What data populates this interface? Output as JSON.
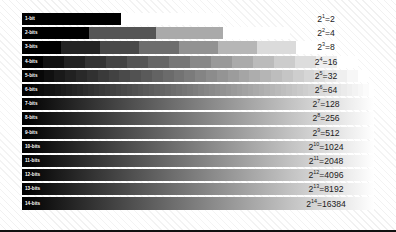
{
  "figure": {
    "background_color": "#ffffff",
    "hatch_color": "#e6e6e6",
    "rule_color": "#111111",
    "ramp_start_color": "#000000",
    "ramp_end_color": "#ffffff",
    "label_color": "#ffffff",
    "expression_color": "#1b1b1b"
  },
  "rows": [
    {
      "label": "1-bit",
      "bits": 1,
      "levels": 2,
      "base": "2",
      "exponent": "1",
      "equals": "=",
      "result": "2",
      "expression": "2¹=2",
      "width_pct": 56.5
    },
    {
      "label": "2-bits",
      "bits": 2,
      "levels": 4,
      "base": "2",
      "exponent": "2",
      "equals": "=",
      "result": "4",
      "expression": "2²=4",
      "width_pct": 76.0
    },
    {
      "label": "3-bits",
      "bits": 3,
      "levels": 8,
      "base": "2",
      "exponent": "3",
      "equals": "=",
      "result": "8",
      "expression": "2³=8",
      "width_pct": 89.0
    },
    {
      "label": "4-bits",
      "bits": 4,
      "levels": 16,
      "base": "2",
      "exponent": "4",
      "equals": "=",
      "result": "16",
      "expression": "2⁴=16",
      "width_pct": 95.5
    },
    {
      "label": "5-bits",
      "bits": 5,
      "levels": 32,
      "base": "2",
      "exponent": "5",
      "equals": "=",
      "result": "32",
      "expression": "2⁵=32",
      "width_pct": 98.5
    },
    {
      "label": "6-bits",
      "bits": 6,
      "levels": 64,
      "base": "2",
      "exponent": "6",
      "equals": "=",
      "result": "64",
      "expression": "2⁶=64",
      "width_pct": 100
    },
    {
      "label": "7-bits",
      "bits": 7,
      "levels": 128,
      "base": "2",
      "exponent": "7",
      "equals": "=",
      "result": "128",
      "expression": "2⁷=128",
      "width_pct": 100
    },
    {
      "label": "8-bits",
      "bits": 8,
      "levels": 256,
      "base": "2",
      "exponent": "8",
      "equals": "=",
      "result": "256",
      "expression": "2⁸=256",
      "width_pct": 100
    },
    {
      "label": "9-bits",
      "bits": 9,
      "levels": 512,
      "base": "2",
      "exponent": "9",
      "equals": "=",
      "result": "512",
      "expression": "2⁹=512",
      "width_pct": 100
    },
    {
      "label": "10-bits",
      "bits": 10,
      "levels": 1024,
      "base": "2",
      "exponent": "10",
      "equals": "=",
      "result": "1024",
      "expression": "2¹⁰=1024",
      "width_pct": 100
    },
    {
      "label": "11-bits",
      "bits": 11,
      "levels": 2048,
      "base": "2",
      "exponent": "11",
      "equals": "=",
      "result": "2048",
      "expression": "2¹¹=2048",
      "width_pct": 100
    },
    {
      "label": "12-bits",
      "bits": 12,
      "levels": 4096,
      "base": "2",
      "exponent": "12",
      "equals": "=",
      "result": "4096",
      "expression": "2¹²=4096",
      "width_pct": 100
    },
    {
      "label": "13-bits",
      "bits": 13,
      "levels": 8192,
      "base": "2",
      "exponent": "13",
      "equals": "=",
      "result": "8192",
      "expression": "2¹³=8192",
      "width_pct": 100
    },
    {
      "label": "14-bits",
      "bits": 14,
      "levels": 16384,
      "base": "2",
      "exponent": "14",
      "equals": "=",
      "result": "16384",
      "expression": "2¹⁴=16384",
      "width_pct": 100
    }
  ],
  "chart_data": {
    "type": "bar",
    "xlabel": "",
    "ylabel": "",
    "categories": [
      "1-bit",
      "2-bits",
      "3-bits",
      "4-bits",
      "5-bits",
      "6-bits",
      "7-bits",
      "8-bits",
      "9-bits",
      "10-bits",
      "11-bits",
      "12-bits",
      "13-bits",
      "14-bits"
    ],
    "values": [
      2,
      4,
      8,
      16,
      32,
      64,
      128,
      256,
      512,
      1024,
      2048,
      4096,
      8192,
      16384
    ],
    "annotations": [
      "2¹=2",
      "2²=4",
      "2³=8",
      "2⁴=16",
      "2⁵=32",
      "2⁶=64",
      "2⁷=128",
      "2⁸=256",
      "2⁹=512",
      "2¹⁰=1024",
      "2¹¹=2048",
      "2¹²=4096",
      "2¹³=8192",
      "2¹⁴=16384"
    ],
    "bar_lengths_pct": [
      56.5,
      76.0,
      89.0,
      95.5,
      98.5,
      100,
      100,
      100,
      100,
      100,
      100,
      100,
      100,
      100
    ],
    "grid": false,
    "legend": "none"
  }
}
